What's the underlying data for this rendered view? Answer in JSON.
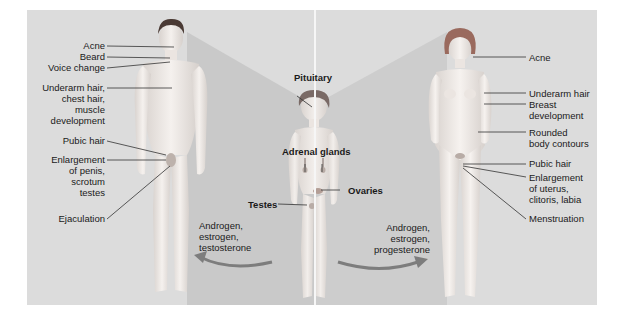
{
  "figure": {
    "type": "puberty-body-changes-illustration",
    "colors": {
      "background": "#ffffff",
      "panel": "#dcdcdc",
      "panel_shadow": "#c6c6c6",
      "skin": "#efeae6",
      "hair_male": "#4a3a34",
      "hair_female": "#9a6a5e",
      "arrow": "#7d7d7d",
      "text": "#1a1a1a",
      "leader_line": "#333333"
    }
  },
  "male": {
    "labels": [
      {
        "lines": [
          "Acne"
        ]
      },
      {
        "lines": [
          "Beard"
        ]
      },
      {
        "lines": [
          "Voice change"
        ]
      },
      {
        "lines": [
          "Underarm hair,",
          "chest hair,",
          "muscle",
          "development"
        ]
      },
      {
        "lines": [
          "Pubic hair"
        ]
      },
      {
        "lines": [
          "Enlargement",
          "of penis,",
          "scrotum",
          "testes"
        ]
      },
      {
        "lines": [
          "Ejaculation"
        ]
      }
    ],
    "hormones": [
      "Androgen,",
      "estrogen,",
      "testosterone"
    ]
  },
  "child": {
    "labels": {
      "pituitary": "Pituitary",
      "adrenal": "Adrenal glands",
      "testes": "Testes",
      "ovaries": "Ovaries"
    }
  },
  "female": {
    "labels": [
      {
        "lines": [
          "Acne"
        ]
      },
      {
        "lines": [
          "Underarm hair"
        ]
      },
      {
        "lines": [
          "Breast",
          "development"
        ]
      },
      {
        "lines": [
          "Rounded",
          "body contours"
        ]
      },
      {
        "lines": [
          "Pubic hair"
        ]
      },
      {
        "lines": [
          "Enlargement",
          "of uterus,",
          "clitoris, labia"
        ]
      },
      {
        "lines": [
          "Menstruation"
        ]
      }
    ],
    "hormones": [
      "Androgen,",
      "estrogen,",
      "progesterone"
    ]
  }
}
